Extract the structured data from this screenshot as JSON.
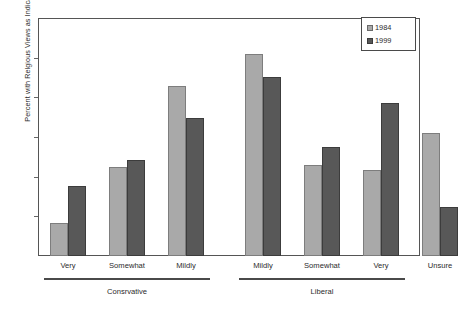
{
  "chart_data": {
    "type": "bar",
    "title": "",
    "xlabel": "",
    "ylabel": "Percent with Relgious Views as Indicated",
    "ylim": [
      0,
      30
    ],
    "yticks": [
      0,
      5,
      10,
      15,
      20,
      25,
      30
    ],
    "ytick_labels": [
      "0",
      "5",
      "10",
      "15",
      "20",
      "25",
      "30"
    ],
    "grid": false,
    "legend_position": "top-right",
    "categories": [
      "Very",
      "Somewhat",
      "Mildly",
      "Mildly",
      "Somewhat",
      "Very",
      "Unsure"
    ],
    "series": [
      {
        "name": "1984",
        "color": "#a9a9a9",
        "values": [
          4.2,
          11.2,
          21.4,
          25.5,
          11.5,
          10.8,
          15.5
        ]
      },
      {
        "name": "1999",
        "color": "#585858",
        "values": [
          8.8,
          12.1,
          17.4,
          22.6,
          13.7,
          19.3,
          6.2
        ]
      }
    ],
    "group_brackets": [
      {
        "label": "Consrvative",
        "categories": [
          "Very",
          "Somewhat",
          "Mildly"
        ]
      },
      {
        "label": "Liberal",
        "categories": [
          "Mildly",
          "Somewhat",
          "Very"
        ]
      }
    ]
  },
  "legend": {
    "items": [
      {
        "label": "1984",
        "swatch": "light-gray-swatch"
      },
      {
        "label": "1999",
        "swatch": "dark-gray-swatch"
      }
    ]
  }
}
